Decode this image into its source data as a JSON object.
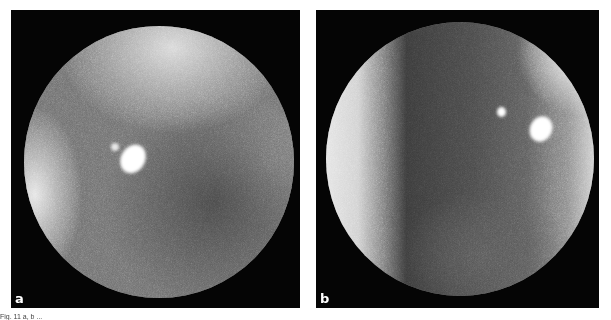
{
  "figure": {
    "panels": [
      {
        "id": "a",
        "label": "a",
        "description": "circular grainy grayscale view with a bright oval spot left of center and a bright band at left edge"
      },
      {
        "id": "b",
        "label": "b",
        "description": "circular grainy grayscale view with dark vertical band, bright left crescent, small bright dot and larger bright oval spot upper right"
      }
    ],
    "caption": "Fig. 11  a, b  ..."
  }
}
